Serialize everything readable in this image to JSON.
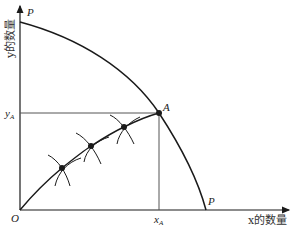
{
  "diagram": {
    "type": "production-possibility-frontier",
    "axes": {
      "x_label": "x的数量",
      "y_label": "y的数量",
      "origin_label": "O"
    },
    "frontier": {
      "label_top": "P",
      "label_right": "P"
    },
    "point_A": {
      "label": "A",
      "x_label": "x",
      "x_sub": "A",
      "y_label": "y",
      "y_sub": "A"
    },
    "contract_curve_points": 3,
    "colors": {
      "line": "#1a1a1a",
      "guide": "#555555",
      "background": "#ffffff"
    }
  }
}
